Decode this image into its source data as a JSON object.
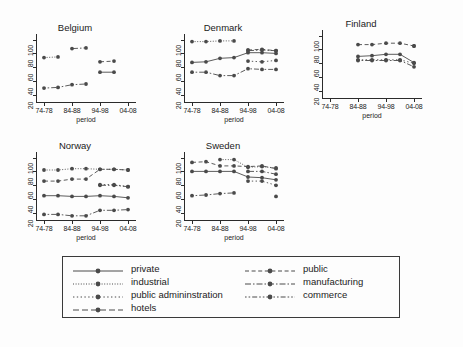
{
  "chart_data": {
    "type": "line",
    "title": "",
    "xlabel": "period",
    "ylabel": "",
    "ylim": [
      10,
      108
    ],
    "yticks": [
      20,
      40,
      60,
      80,
      100
    ],
    "ytick_labels": [
      "20",
      "40",
      "60",
      "80",
      "100"
    ],
    "grid": false,
    "legend_position": "bottom",
    "x": [
      "74-78",
      "79-83",
      "84-88",
      "89-93",
      "94-98",
      "99-03",
      "04-08"
    ],
    "xtick_labels": [
      "74-78",
      "84-88",
      "94-98",
      "04-08"
    ],
    "xtick_positions": [
      0,
      2,
      4,
      6
    ],
    "panels": [
      {
        "title": "Belgium",
        "series": [
          {
            "name": "private",
            "values": [
              null,
              null,
              null,
              null,
              53,
              53,
              null
            ]
          },
          {
            "name": "public",
            "values": [
              null,
              null,
              null,
              null,
              68,
              69,
              null
            ]
          },
          {
            "name": "industrial",
            "values": [
              74,
              75,
              null,
              null,
              null,
              null,
              null
            ]
          },
          {
            "name": "manufacturing",
            "values": [
              null,
              null,
              87,
              88,
              null,
              null,
              null
            ]
          },
          {
            "name": "public admininstration",
            "values": [
              null,
              null,
              null,
              null,
              null,
              null,
              null
            ]
          },
          {
            "name": "commerce",
            "values": [
              30,
              31,
              35,
              36,
              null,
              null,
              null
            ]
          },
          {
            "name": "hotels",
            "values": [
              null,
              null,
              null,
              null,
              null,
              null,
              null
            ]
          }
        ]
      },
      {
        "title": "Denmark",
        "series": [
          {
            "name": "private",
            "values": [
              67,
              68,
              73,
              74,
              81,
              81,
              80
            ]
          },
          {
            "name": "public",
            "values": [
              null,
              null,
              null,
              null,
              85,
              86,
              84
            ]
          },
          {
            "name": "industrial",
            "values": [
              97,
              97,
              98,
              98,
              null,
              null,
              null
            ]
          },
          {
            "name": "manufacturing",
            "values": [
              null,
              null,
              null,
              null,
              84,
              85,
              84
            ]
          },
          {
            "name": "public admininstration",
            "values": [
              null,
              null,
              null,
              null,
              69,
              68,
              70
            ]
          },
          {
            "name": "commerce",
            "values": [
              53,
              53,
              48,
              48,
              58,
              57,
              57
            ]
          },
          {
            "name": "hotels",
            "values": [
              null,
              null,
              null,
              null,
              null,
              null,
              null
            ]
          }
        ]
      },
      {
        "title": "Finland",
        "series": [
          {
            "name": "private",
            "values": [
              null,
              null,
              70,
              71,
              73,
              73,
              61
            ]
          },
          {
            "name": "public",
            "values": [
              null,
              null,
              87,
              87,
              89,
              89,
              85
            ]
          },
          {
            "name": "industrial",
            "values": [
              null,
              null,
              null,
              null,
              null,
              null,
              null
            ]
          },
          {
            "name": "manufacturing",
            "values": [
              null,
              null,
              null,
              null,
              null,
              null,
              85
            ]
          },
          {
            "name": "public admininstration",
            "values": [
              null,
              null,
              65,
              65,
              65,
              65,
              60
            ]
          },
          {
            "name": "commerce",
            "values": [
              null,
              null,
              64,
              64,
              64,
              64,
              55
            ]
          },
          {
            "name": "hotels",
            "values": [
              null,
              null,
              null,
              null,
              null,
              null,
              null
            ]
          }
        ]
      },
      {
        "title": "Norway",
        "series": [
          {
            "name": "private",
            "values": [
              45,
              45,
              44,
              44,
              45,
              44,
              42
            ]
          },
          {
            "name": "public",
            "values": [
              66,
              66,
              69,
              69,
              83,
              83,
              82
            ]
          },
          {
            "name": "industrial",
            "values": [
              82,
              82,
              84,
              84,
              83,
              83,
              82
            ]
          },
          {
            "name": "manufacturing",
            "values": [
              null,
              null,
              null,
              null,
              60,
              60,
              58
            ]
          },
          {
            "name": "public admininstration",
            "values": [
              null,
              null,
              null,
              null,
              61,
              61,
              58
            ]
          },
          {
            "name": "commerce",
            "values": [
              18,
              18,
              16,
              16,
              24,
              24,
              25
            ]
          },
          {
            "name": "hotels",
            "values": [
              null,
              null,
              null,
              null,
              null,
              null,
              null
            ]
          }
        ]
      },
      {
        "title": "Sweden",
        "series": [
          {
            "name": "private",
            "values": [
              80,
              80,
              80,
              80,
              72,
              71,
              68
            ]
          },
          {
            "name": "public",
            "values": [
              93,
              94,
              88,
              88,
              87,
              88,
              84
            ]
          },
          {
            "name": "industrial",
            "values": [
              null,
              null,
              97,
              97,
              86,
              87,
              85
            ]
          },
          {
            "name": "manufacturing",
            "values": [
              null,
              null,
              null,
              null,
              80,
              80,
              76
            ]
          },
          {
            "name": "public admininstration",
            "values": [
              null,
              null,
              null,
              null,
              66,
              66,
              60
            ]
          },
          {
            "name": "commerce",
            "values": [
              45,
              46,
              48,
              49,
              null,
              null,
              44
            ]
          },
          {
            "name": "hotels",
            "values": [
              null,
              null,
              null,
              null,
              null,
              null,
              null
            ]
          }
        ]
      }
    ]
  },
  "legend": {
    "items": [
      {
        "label": "private",
        "style": "solid",
        "column": "left"
      },
      {
        "label": "industrial",
        "style": "dotted",
        "column": "left"
      },
      {
        "label": "public admininstration",
        "style": "dotted-wide",
        "column": "left"
      },
      {
        "label": "hotels",
        "style": "longdash",
        "column": "left"
      },
      {
        "label": "public",
        "style": "dashed",
        "column": "right"
      },
      {
        "label": "manufacturing",
        "style": "dashdot",
        "column": "right"
      },
      {
        "label": "commerce",
        "style": "dashdotdot",
        "column": "right"
      }
    ]
  },
  "colors": {
    "axis": "#2b2b2b",
    "marker": "#4a4a4a",
    "line": "#4a4a4a",
    "background": "#fdfdfd",
    "legend_border": "#3a3a3a"
  }
}
